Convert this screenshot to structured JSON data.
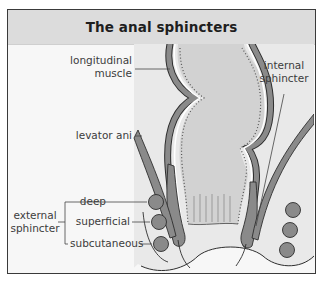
{
  "header": {
    "title": "The anal sphincters"
  },
  "labels": {
    "longitudinal_muscle": [
      "longitudinal",
      "muscle"
    ],
    "internal_sphincter": [
      "internal",
      "sphincter"
    ],
    "levator_ani": "levator ani",
    "external_sphincter": [
      "external",
      "sphincter"
    ],
    "external_parts": [
      "deep",
      "superficial",
      "subcutaneous"
    ]
  },
  "colors": {
    "frame_border": "#3a3a3a",
    "header_bg": "#dcdcdc",
    "panel_bg": "#e9e9e9",
    "lumen_fill": "#d2d2d2",
    "muscle_fill": "#8a8a8a",
    "outline": "#2e2e2e"
  }
}
